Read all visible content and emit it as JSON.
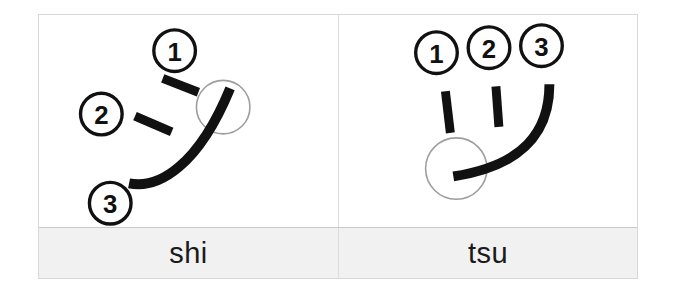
{
  "table": {
    "caption_row_bg": "#f1f1f1",
    "border_color": "#d8d8d8",
    "stroke_color": "#111111",
    "guide_circle_color": "#9a9a9a",
    "number_circle_color": "#111111"
  },
  "cards": [
    {
      "id": "shi",
      "label": "shi",
      "stroke_count": 3,
      "strokes": [
        {
          "number": "1",
          "name": "stroke-1",
          "type": "short-dash"
        },
        {
          "number": "2",
          "name": "stroke-2",
          "type": "short-dash"
        },
        {
          "number": "3",
          "name": "stroke-3",
          "type": "long-curve"
        }
      ],
      "numbers": [
        "1",
        "2",
        "3"
      ],
      "end_marker": "circle"
    },
    {
      "id": "tsu",
      "label": "tsu",
      "stroke_count": 3,
      "strokes": [
        {
          "number": "1",
          "name": "stroke-1",
          "type": "short-dash"
        },
        {
          "number": "2",
          "name": "stroke-2",
          "type": "short-dash"
        },
        {
          "number": "3",
          "name": "stroke-3",
          "type": "long-curve"
        }
      ],
      "numbers": [
        "1",
        "2",
        "3"
      ],
      "end_marker": "circle"
    }
  ]
}
